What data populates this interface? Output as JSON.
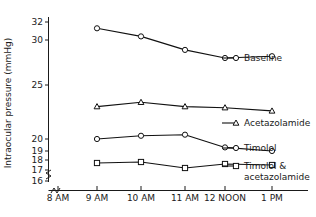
{
  "chart_data": {
    "type": "line",
    "title": "",
    "xlabel": "",
    "ylabel": "Intraocular pressure (mmHg)",
    "grid": false,
    "legend_position": "right",
    "x_axis_broken": true,
    "y_axis_broken": true,
    "categories": [
      "8 AM",
      "9 AM",
      "10 AM",
      "11 AM",
      "12 NOON",
      "1 PM"
    ],
    "x_tick_labels": [
      "8 AM",
      "9 AM",
      "10 AM",
      "11 AM",
      "12 NOON",
      "1 PM"
    ],
    "y_tick_labels": [
      "32",
      "30",
      "25",
      "20",
      "19",
      "18",
      "17",
      "16"
    ],
    "y_tick_values": [
      32,
      30,
      25,
      20,
      19,
      18,
      17,
      16
    ],
    "ylim": [
      16,
      32
    ],
    "x": [
      "9 AM",
      "10 AM",
      "11 AM",
      "12 NOON",
      "1 PM"
    ],
    "series": [
      {
        "name": "Baseline",
        "marker": "circle",
        "x": [
          "9 AM",
          "10 AM",
          "11 AM",
          "12 NOON",
          "1 PM"
        ],
        "values": [
          31.3,
          30.4,
          28.9,
          28.0,
          28.2
        ]
      },
      {
        "name": "Acetazolamide",
        "marker": "triangle",
        "x": [
          "9 AM",
          "10 AM",
          "11 AM",
          "12 NOON",
          "1 PM"
        ],
        "values": [
          23.0,
          23.4,
          23.0,
          22.9,
          22.6
        ]
      },
      {
        "name": "Timolol",
        "marker": "circle",
        "x": [
          "9 AM",
          "10 AM",
          "11 AM",
          "12 NOON",
          "1 PM"
        ],
        "values": [
          20.0,
          20.3,
          20.4,
          19.3,
          19.0
        ]
      },
      {
        "name": "Timolol & acetazolamide",
        "marker": "square",
        "x": [
          "9 AM",
          "10 AM",
          "11 AM",
          "12 NOON",
          "1 PM"
        ],
        "values": [
          17.7,
          17.8,
          17.2,
          17.6,
          17.5
        ]
      }
    ]
  },
  "legend": {
    "entries": [
      {
        "label": "Baseline",
        "marker": "circle"
      },
      {
        "label": "Acetazolamide",
        "marker": "triangle"
      },
      {
        "label": "Timolol",
        "marker": "circle"
      },
      {
        "label_line1": "Timolol &",
        "label_line2": "acetazolamide",
        "marker": "square"
      }
    ]
  },
  "colors": {
    "line": "#111111",
    "marker_fill": "#ffffff",
    "axis": "#1a1a1a",
    "background": "#ffffff"
  }
}
